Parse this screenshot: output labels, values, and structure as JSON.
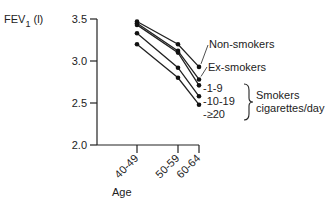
{
  "chart_data": {
    "type": "line",
    "title": "",
    "ylabel": "FEV",
    "ylabel_sub": "1",
    "ylabel_unit": "(l)",
    "xlabel": "Age",
    "categories": [
      "40-49",
      "50-59",
      "60-64"
    ],
    "x_positions": [
      137,
      178,
      199
    ],
    "ylim": [
      2.0,
      3.5
    ],
    "yticks": [
      2.0,
      2.5,
      3.0,
      3.5
    ],
    "ytick_labels": [
      "2.0",
      "2.5",
      "3.0",
      "3.5"
    ],
    "grid": false,
    "series": [
      {
        "name": "Non-smokers",
        "values": [
          3.47,
          3.2,
          2.93
        ]
      },
      {
        "name": "Ex-smokers",
        "values": [
          3.45,
          3.12,
          2.78
        ]
      },
      {
        "name": "1-9",
        "values": [
          3.43,
          3.1,
          2.71
        ]
      },
      {
        "name": "10-19",
        "values": [
          3.33,
          2.92,
          2.58
        ]
      },
      {
        "name": "≥20",
        "values": [
          3.2,
          2.8,
          2.48
        ]
      }
    ],
    "annotations": {
      "smokers_group_label_line1": "Smokers",
      "smokers_group_label_line2": "cigarettes/day"
    },
    "legend_position": "inline-right"
  }
}
